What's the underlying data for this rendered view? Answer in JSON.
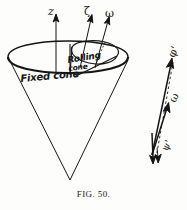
{
  "figure": {
    "caption": "FIG. 50.",
    "background_color": "#fdfdfc",
    "ink_color": "#151515"
  },
  "cone_diagram": {
    "axes": [
      {
        "name": "z-axis",
        "label": "z",
        "description": "vertical arrow through apex of fixed cone"
      },
      {
        "name": "zeta-axis",
        "label": "ζ",
        "description": "slanted arrow, instantaneous body axis"
      },
      {
        "name": "omega-axis",
        "label": "ω",
        "description": "slanted arrow, angular velocity"
      }
    ],
    "annotations": [
      {
        "name": "rolling-cone-label",
        "line1": "Rolling",
        "line2": "cone"
      },
      {
        "name": "fixed-cone-label",
        "text": "Fixed cone"
      }
    ]
  },
  "vector_diagram": {
    "vectors": [
      {
        "name": "phi-prime-vector",
        "label": "φ'",
        "style": "solid"
      },
      {
        "name": "omega-vector",
        "label": "ω",
        "style": "solid"
      },
      {
        "name": "psi-prime-vector",
        "label": "ψ'",
        "style": "solid"
      },
      {
        "name": "closure-line",
        "label": "",
        "style": "dashed"
      }
    ]
  }
}
